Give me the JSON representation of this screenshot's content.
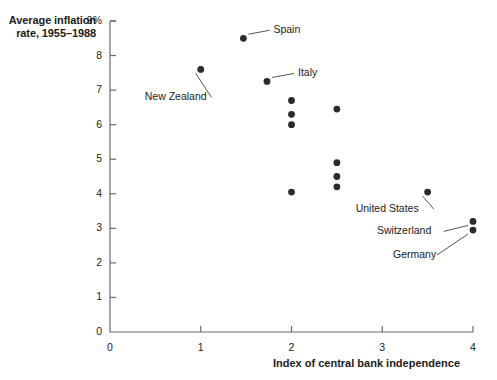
{
  "chart_data": {
    "type": "scatter",
    "title": "",
    "ylabel": "Average inflation rate, 1955–1988",
    "xlabel": "Index of central bank independence",
    "xlim": [
      0,
      4
    ],
    "ylim": [
      0,
      9
    ],
    "xticks": [
      "0",
      "1",
      "2",
      "3",
      "4"
    ],
    "xtick_values": [
      0,
      1,
      2,
      3,
      4
    ],
    "yticks": [
      "0",
      "1",
      "2",
      "3",
      "4",
      "5",
      "6",
      "7",
      "8",
      "9%"
    ],
    "ytick_values": [
      0,
      1,
      2,
      3,
      4,
      5,
      6,
      7,
      8,
      9
    ],
    "grid": false,
    "legend": "none",
    "points": [
      {
        "x": 1.47,
        "y": 8.5,
        "label": "Spain",
        "label_dx": 30,
        "label_dy": -8
      },
      {
        "x": 1.0,
        "y": 7.6,
        "label": "New Zealand",
        "label_dx": -56,
        "label_dy": 28
      },
      {
        "x": 1.73,
        "y": 7.25,
        "label": "Italy",
        "label_dx": 31,
        "label_dy": -8
      },
      {
        "x": 2.0,
        "y": 6.7,
        "label": "",
        "label_dx": 0,
        "label_dy": 0
      },
      {
        "x": 2.0,
        "y": 6.3,
        "label": "",
        "label_dx": 0,
        "label_dy": 0
      },
      {
        "x": 2.0,
        "y": 6.0,
        "label": "",
        "label_dx": 0,
        "label_dy": 0
      },
      {
        "x": 2.5,
        "y": 6.45,
        "label": "",
        "label_dx": 0,
        "label_dy": 0
      },
      {
        "x": 2.5,
        "y": 4.9,
        "label": "",
        "label_dx": 0,
        "label_dy": 0
      },
      {
        "x": 2.5,
        "y": 4.5,
        "label": "",
        "label_dx": 0,
        "label_dy": 0
      },
      {
        "x": 2.5,
        "y": 4.2,
        "label": "",
        "label_dx": 0,
        "label_dy": 0
      },
      {
        "x": 2.0,
        "y": 4.05,
        "label": "",
        "label_dx": 0,
        "label_dy": 0
      },
      {
        "x": 3.5,
        "y": 4.05,
        "label": "United States",
        "label_dx": -72,
        "label_dy": 17
      },
      {
        "x": 4.0,
        "y": 3.2,
        "label": "Switzerland",
        "label_dx": -96,
        "label_dy": 10
      },
      {
        "x": 4.0,
        "y": 2.95,
        "label": "Germany",
        "label_dx": -80,
        "label_dy": 25
      }
    ],
    "point_color": "#2b2b2b",
    "axis_color": "#6a6a6a",
    "background": "#ffffff"
  }
}
